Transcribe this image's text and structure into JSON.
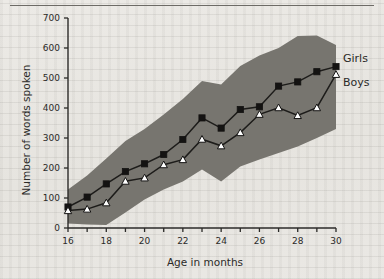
{
  "figure": {
    "background_color": "#e8e7e3",
    "ink_color": "#2b2a28",
    "band_color": "#77756f"
  },
  "chart_data": {
    "type": "line",
    "title": "",
    "xlabel": "Age in months",
    "ylabel": "Number of words spoken",
    "xlim": [
      16,
      30
    ],
    "ylim": [
      0,
      700
    ],
    "grid": false,
    "legend_position": "right-of-line-ends",
    "x": [
      16,
      17,
      18,
      19,
      20,
      21,
      22,
      23,
      24,
      25,
      26,
      27,
      28,
      29,
      30
    ],
    "xticks": [
      16,
      17,
      18,
      19,
      20,
      21,
      22,
      23,
      24,
      25,
      26,
      27,
      28,
      29,
      30
    ],
    "xtick_labels": [
      "16",
      "",
      "18",
      "",
      "20",
      "",
      "22",
      "",
      "24",
      "",
      "26",
      "",
      "28",
      "",
      "30"
    ],
    "yticks": [
      0,
      100,
      200,
      300,
      400,
      500,
      600,
      700
    ],
    "ytick_labels": [
      "0",
      "100",
      "200",
      "300",
      "400",
      "500",
      "600",
      "700"
    ],
    "series": [
      {
        "name": "Girls",
        "marker": "filled-square",
        "values": [
          70,
          103,
          147,
          188,
          214,
          245,
          295,
          367,
          333,
          395,
          404,
          473,
          487,
          521,
          538
        ]
      },
      {
        "name": "Boys",
        "marker": "open-triangle",
        "values": [
          58,
          63,
          84,
          156,
          167,
          211,
          228,
          296,
          274,
          318,
          379,
          401,
          375,
          401,
          512
        ]
      }
    ],
    "band": {
      "label": "shaded range band",
      "upper": [
        128,
        175,
        232,
        290,
        330,
        378,
        430,
        490,
        478,
        540,
        575,
        600,
        640,
        642,
        610
      ],
      "lower": [
        15,
        12,
        10,
        52,
        95,
        128,
        155,
        195,
        155,
        205,
        228,
        250,
        272,
        300,
        330
      ]
    }
  },
  "annotations": {
    "girls_label": "Girls",
    "boys_label": "Boys"
  }
}
